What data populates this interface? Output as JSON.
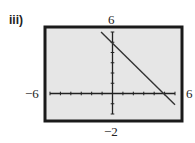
{
  "part_label": "iii)",
  "chart_data": {
    "type": "line",
    "title": "",
    "xlabel": "",
    "ylabel": "",
    "xlim": [
      -6,
      6
    ],
    "ylim": [
      -2,
      6
    ],
    "window_labels": {
      "xmin": "−6",
      "xmax": "6",
      "ymin": "−2",
      "ymax": "6"
    },
    "xscale": 1,
    "yscale": 1,
    "grid": false,
    "series": [
      {
        "name": "y = -x + 5",
        "x": [
          -1.1,
          6
        ],
        "y": [
          6,
          -1.1
        ]
      }
    ],
    "colors": {
      "screen_bg": "#e6e6e6",
      "frame": "#1a1a1a",
      "line": "#333333"
    }
  }
}
